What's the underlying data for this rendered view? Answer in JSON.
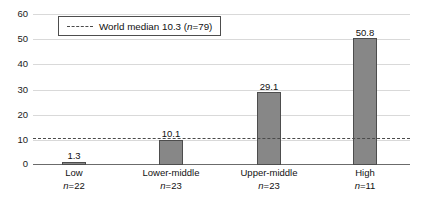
{
  "chart_data": {
    "type": "bar",
    "title": "",
    "xlabel": "",
    "ylabel": "",
    "ylim": [
      0,
      60
    ],
    "yticks": [
      0,
      10,
      20,
      30,
      40,
      50,
      60
    ],
    "grid": true,
    "categories": [
      "Low",
      "Lower-middle",
      "Upper-middle",
      "High"
    ],
    "category_n": [
      "n=22",
      "n=23",
      "n=23",
      "n=11"
    ],
    "values": [
      1.3,
      10.1,
      29.1,
      50.8
    ],
    "value_labels": [
      "1.3",
      "10.1",
      "29.1",
      "50.8"
    ],
    "bar_color": "#878787",
    "bar_edge_color": "#4d4d4d",
    "reference_line": {
      "value": 10.3,
      "style": "dashed",
      "color": "#4a4a4a",
      "legend_label": "World median 10.3 (n=79)",
      "legend_label_prefix": "World median 10.3 (",
      "legend_label_italic": "n",
      "legend_label_suffix": "=79)",
      "legend_position": "upper-left-inside"
    }
  },
  "ytick_labels": [
    "60",
    "50",
    "40",
    "30",
    "20",
    "10",
    "0"
  ]
}
